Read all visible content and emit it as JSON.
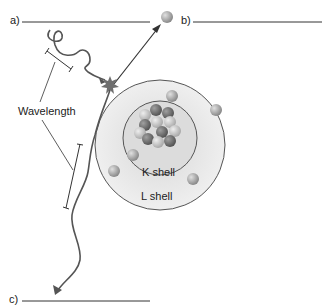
{
  "labels": {
    "a": "a)",
    "b": "b)",
    "c": "c)",
    "wavelength": "Wavelength",
    "k_shell": "K shell",
    "l_shell": "L shell"
  },
  "colors": {
    "line": "#333333",
    "wave": "#555555",
    "shell_fill": "#e6e6e6",
    "electron": "#a8a8a8",
    "proton": "#7d7d7d",
    "neutron": "#c4c4c4",
    "burst": "#6f6f6f"
  }
}
